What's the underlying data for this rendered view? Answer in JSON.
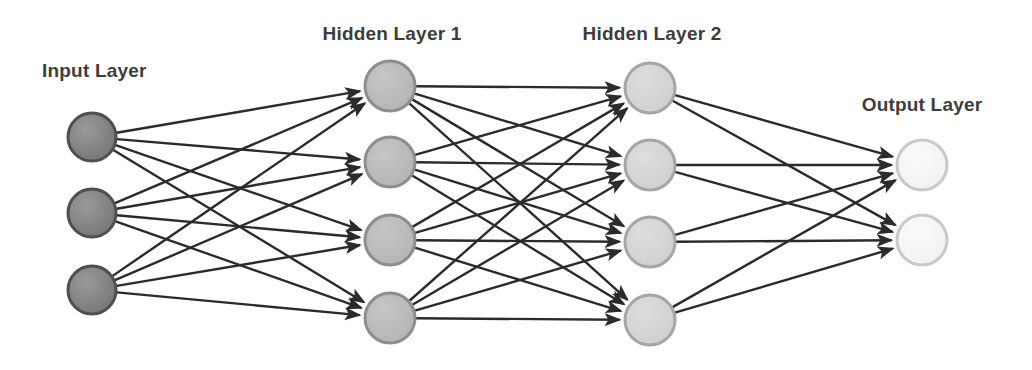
{
  "diagram": {
    "background_color": "#ffffff",
    "width": 1032,
    "height": 370,
    "edge_color": "#2b2b2b",
    "edge_width": 2.4,
    "label_color": "#3d3d3d",
    "label_font_size": 19
  },
  "labels": {
    "input": "Input Layer",
    "hidden1": "Hidden Layer 1",
    "hidden2": "Hidden Layer 2",
    "output": "Output Layer"
  },
  "chart_data": {
    "type": "diagram",
    "layers": [
      {
        "id": "input",
        "label": "Input Layer",
        "node_count": 3,
        "fill": "#7a7a7a",
        "stroke": "#4f4f4f",
        "radius": 24,
        "x": 92,
        "node_y": [
          137,
          213,
          290
        ],
        "label_x": 42,
        "label_y": 77,
        "label_anchor": "start"
      },
      {
        "id": "hidden1",
        "label": "Hidden Layer 1",
        "node_count": 4,
        "fill": "#b9b9b9",
        "stroke": "#8e8e8e",
        "radius": 25,
        "x": 390,
        "node_y": [
          86,
          162,
          240,
          318
        ],
        "label_x": 392,
        "label_y": 40,
        "label_anchor": "middle"
      },
      {
        "id": "hidden2",
        "label": "Hidden Layer 2",
        "node_count": 4,
        "fill": "#d2d2d2",
        "stroke": "#a6a6a6",
        "radius": 25,
        "x": 650,
        "node_y": [
          88,
          165,
          242,
          320
        ],
        "label_x": 652,
        "label_y": 40,
        "label_anchor": "middle"
      },
      {
        "id": "output",
        "label": "Output Layer",
        "node_count": 2,
        "fill": "#f4f4f4",
        "stroke": "#c9c9c9",
        "radius": 25,
        "x": 922,
        "node_y": [
          165,
          240
        ],
        "label_x": 922,
        "label_y": 111,
        "label_anchor": "middle"
      }
    ],
    "connections": [
      {
        "from": "input",
        "to": "hidden1",
        "fully_connected": true,
        "edge_count": 12
      },
      {
        "from": "hidden1",
        "to": "hidden2",
        "fully_connected": true,
        "edge_count": 16
      },
      {
        "from": "hidden2",
        "to": "output",
        "fully_connected": true,
        "edge_count": 8
      }
    ],
    "total_nodes": 13,
    "total_edges": 36,
    "arrow_direction": "left-to-right"
  }
}
